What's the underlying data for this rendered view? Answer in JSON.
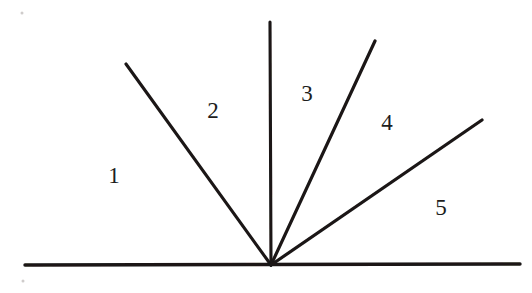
{
  "figure": {
    "kind": "hand-drawn-geometry-diagram",
    "canvas": {
      "width": 532,
      "height": 293
    },
    "background_color": "#ffffff",
    "ink_color": "#1a1716",
    "vertex": {
      "x": 271,
      "y": 265
    },
    "baseline": {
      "name": "horizontal-baseline",
      "x1": 25,
      "y1": 265,
      "x2": 520,
      "y2": 264,
      "stroke_width": 3.4
    },
    "rays": [
      {
        "name": "ray-between-1-and-2",
        "x1": 271,
        "y1": 265,
        "x2": 126,
        "y2": 64,
        "stroke_width": 3.1,
        "angle_deg_from_baseline": 125.8
      },
      {
        "name": "ray-between-2-and-3",
        "x1": 271,
        "y1": 265,
        "x2": 270,
        "y2": 22,
        "stroke_width": 3.1,
        "angle_deg_from_baseline": 90.2
      },
      {
        "name": "ray-between-3-and-4",
        "x1": 271,
        "y1": 265,
        "x2": 375,
        "y2": 41,
        "stroke_width": 3.2,
        "angle_deg_from_baseline": 65.1
      },
      {
        "name": "ray-between-4-and-5",
        "x1": 271,
        "y1": 265,
        "x2": 482,
        "y2": 120,
        "stroke_width": 3.2,
        "angle_deg_from_baseline": 34.5
      }
    ],
    "region_labels": [
      {
        "id": "region-1",
        "text": "1",
        "x": 114,
        "y": 175,
        "font_size": 23
      },
      {
        "id": "region-2",
        "text": "2",
        "x": 213,
        "y": 110,
        "font_size": 23
      },
      {
        "id": "region-3",
        "text": "3",
        "x": 307,
        "y": 93,
        "font_size": 23
      },
      {
        "id": "region-4",
        "text": "4",
        "x": 387,
        "y": 122,
        "font_size": 23
      },
      {
        "id": "region-5",
        "text": "5",
        "x": 441,
        "y": 207,
        "font_size": 23
      }
    ],
    "specks": [
      {
        "id": "speck-top-left",
        "x": 22,
        "y": 13
      },
      {
        "id": "speck-bottom-left",
        "x": 23,
        "y": 281
      }
    ]
  }
}
